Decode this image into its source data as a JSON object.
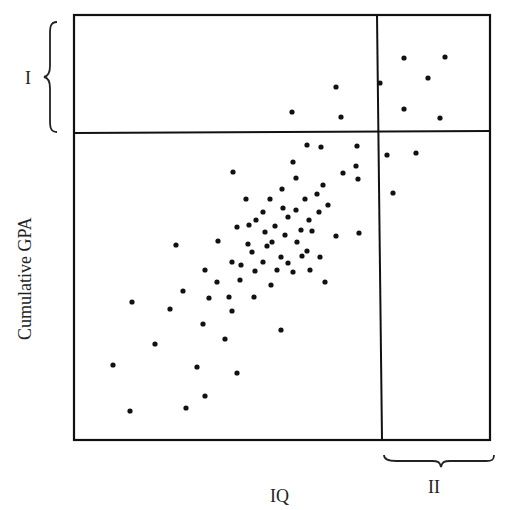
{
  "chart_data": {
    "type": "scatter",
    "title": "",
    "xlabel": "IQ",
    "ylabel": "Cumulative GPA",
    "grid": false,
    "legend": null,
    "ticks": "none",
    "annotations": [
      {
        "label": "I",
        "description": "brace on left marking top band of GPA (region above horizontal divider)"
      },
      {
        "label": "II",
        "description": "brace below x-axis marking right band of IQ (region right of vertical divider)"
      }
    ],
    "frame_px": {
      "left": 74,
      "top": 15,
      "right": 490,
      "bottom": 440
    },
    "dividers_px": {
      "horizontal_y": 133,
      "vertical_x": 381
    },
    "points_px": [
      [
        404,
        58
      ],
      [
        445,
        57
      ],
      [
        428,
        78
      ],
      [
        380,
        83
      ],
      [
        404,
        109
      ],
      [
        440,
        118
      ],
      [
        336,
        87
      ],
      [
        292,
        112
      ],
      [
        341,
        117
      ],
      [
        387,
        155
      ],
      [
        416,
        153
      ],
      [
        393,
        193
      ],
      [
        307,
        145
      ],
      [
        321,
        147
      ],
      [
        357,
        146
      ],
      [
        293,
        162
      ],
      [
        356,
        166
      ],
      [
        358,
        179
      ],
      [
        233,
        172
      ],
      [
        343,
        173
      ],
      [
        323,
        185
      ],
      [
        296,
        178
      ],
      [
        282,
        189
      ],
      [
        317,
        194
      ],
      [
        246,
        199
      ],
      [
        270,
        199
      ],
      [
        305,
        199
      ],
      [
        283,
        208
      ],
      [
        296,
        210
      ],
      [
        328,
        205
      ],
      [
        319,
        212
      ],
      [
        263,
        212
      ],
      [
        288,
        217
      ],
      [
        256,
        220
      ],
      [
        309,
        220
      ],
      [
        275,
        226
      ],
      [
        237,
        227
      ],
      [
        249,
        225
      ],
      [
        301,
        230
      ],
      [
        265,
        232
      ],
      [
        285,
        235
      ],
      [
        312,
        231
      ],
      [
        218,
        241
      ],
      [
        272,
        242
      ],
      [
        248,
        244
      ],
      [
        297,
        242
      ],
      [
        336,
        236
      ],
      [
        359,
        233
      ],
      [
        267,
        246
      ],
      [
        307,
        251
      ],
      [
        302,
        256
      ],
      [
        252,
        252
      ],
      [
        281,
        257
      ],
      [
        263,
        262
      ],
      [
        288,
        263
      ],
      [
        241,
        265
      ],
      [
        320,
        257
      ],
      [
        232,
        262
      ],
      [
        293,
        272
      ],
      [
        255,
        271
      ],
      [
        277,
        270
      ],
      [
        310,
        270
      ],
      [
        240,
        280
      ],
      [
        205,
        270
      ],
      [
        271,
        285
      ],
      [
        325,
        282
      ],
      [
        217,
        282
      ],
      [
        183,
        291
      ],
      [
        176,
        245
      ],
      [
        229,
        297
      ],
      [
        209,
        298
      ],
      [
        254,
        297
      ],
      [
        132,
        302
      ],
      [
        170,
        309
      ],
      [
        232,
        311
      ],
      [
        203,
        324
      ],
      [
        281,
        330
      ],
      [
        155,
        344
      ],
      [
        225,
        339
      ],
      [
        237,
        373
      ],
      [
        197,
        367
      ],
      [
        113,
        365
      ],
      [
        205,
        396
      ],
      [
        186,
        408
      ],
      [
        130,
        411
      ]
    ]
  },
  "axes": {
    "x_label": "IQ",
    "y_label": "Cumulative GPA",
    "bracket_top_label": "I",
    "bracket_right_label": "II"
  }
}
